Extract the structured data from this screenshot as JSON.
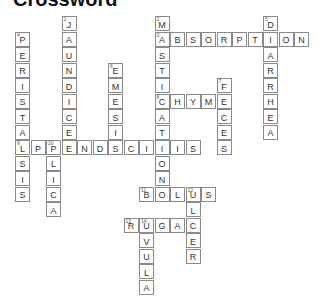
{
  "title": "Crossword",
  "grid": {
    "origin_x": 15,
    "origin_y": 16,
    "cell": 15.5
  },
  "words": [
    {
      "num": "1",
      "answer": "JAUNDICE",
      "dir": "down",
      "col": 3,
      "row": 0
    },
    {
      "num": "2",
      "answer": "MASTICATION",
      "dir": "down",
      "col": 9,
      "row": 0
    },
    {
      "num": "3",
      "answer": "ABSORPTION",
      "dir": "across",
      "col": 9,
      "row": 1
    },
    {
      "num": "4",
      "answer": "PERISTALSIS",
      "dir": "down",
      "col": 0,
      "row": 1
    },
    {
      "num": "5",
      "answer": "DIARRHEA",
      "dir": "down",
      "col": 16,
      "row": 0
    },
    {
      "num": "6",
      "answer": "EMESIS",
      "dir": "down",
      "col": 6,
      "row": 3
    },
    {
      "num": "7",
      "answer": "FECES",
      "dir": "down",
      "col": 13,
      "row": 4
    },
    {
      "num": "8",
      "answer": "CHYME",
      "dir": "across",
      "col": 9,
      "row": 5
    },
    {
      "num": "9",
      "answer": "APPENDICITIS",
      "dir": "across",
      "col": 0,
      "row": 8
    },
    {
      "num": "10",
      "answer": "PLICA",
      "dir": "down",
      "col": 2,
      "row": 8
    },
    {
      "num": "11",
      "answer": "BOLUS",
      "dir": "across",
      "col": 8,
      "row": 11
    },
    {
      "num": "12",
      "answer": "ULCER",
      "dir": "down",
      "col": 11,
      "row": 11
    },
    {
      "num": "13",
      "answer": "RUGAE",
      "dir": "across",
      "col": 7,
      "row": 13
    },
    {
      "num": "14",
      "answer": "UVULA",
      "dir": "down",
      "col": 8,
      "row": 13
    }
  ]
}
